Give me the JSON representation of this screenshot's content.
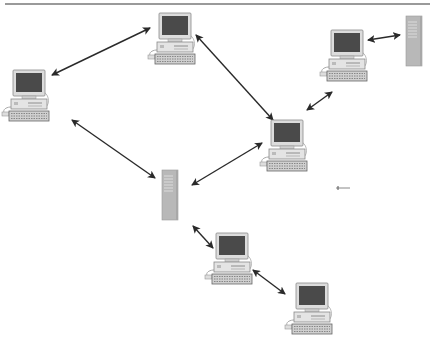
{
  "diagram": {
    "type": "network-topology",
    "colors": {
      "arrow": "#2a2a2a",
      "monitor_bezel": "#d8d8d8",
      "screen": "#4a4a4a",
      "server": "#b8b8b8",
      "top_rule": "#9a9a9a"
    },
    "nodes": [
      {
        "id": "pc-top-center",
        "kind": "computer",
        "x": 152,
        "y": 13
      },
      {
        "id": "pc-left",
        "kind": "computer",
        "x": 5,
        "y": 68
      },
      {
        "id": "pc-top-right",
        "kind": "computer",
        "x": 318,
        "y": 30
      },
      {
        "id": "server-top-right",
        "kind": "server",
        "x": 406,
        "y": 16
      },
      {
        "id": "pc-right-center",
        "kind": "computer",
        "x": 262,
        "y": 120
      },
      {
        "id": "server-center",
        "kind": "server",
        "x": 162,
        "y": 170
      },
      {
        "id": "pc-bottom-center",
        "kind": "computer",
        "x": 205,
        "y": 233
      },
      {
        "id": "pc-bottom-right",
        "kind": "computer",
        "x": 287,
        "y": 283
      }
    ],
    "edges": [
      {
        "from": "pc-left",
        "to": "pc-top-center",
        "x1": 52,
        "y1": 75,
        "x2": 150,
        "y2": 28
      },
      {
        "from": "pc-top-center",
        "to": "pc-right-center",
        "x1": 196,
        "y1": 35,
        "x2": 273,
        "y2": 120
      },
      {
        "from": "pc-top-right",
        "to": "server-top-right",
        "x1": 368,
        "y1": 40,
        "x2": 400,
        "y2": 35
      },
      {
        "from": "pc-right-center",
        "to": "pc-top-right",
        "x1": 307,
        "y1": 110,
        "x2": 332,
        "y2": 92
      },
      {
        "from": "pc-left",
        "to": "server-center",
        "x1": 72,
        "y1": 120,
        "x2": 155,
        "y2": 178
      },
      {
        "from": "pc-right-center",
        "to": "server-center",
        "x1": 262,
        "y1": 143,
        "x2": 192,
        "y2": 185
      },
      {
        "from": "server-center",
        "to": "pc-bottom-center",
        "x1": 193,
        "y1": 226,
        "x2": 213,
        "y2": 248
      },
      {
        "from": "pc-bottom-center",
        "to": "pc-bottom-right",
        "x1": 253,
        "y1": 270,
        "x2": 285,
        "y2": 294
      }
    ],
    "stray_mark": {
      "x": 338,
      "y": 188
    }
  }
}
